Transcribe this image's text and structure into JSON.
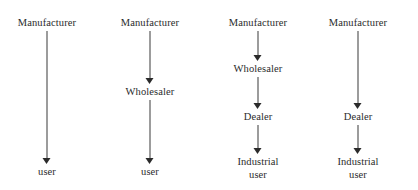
{
  "diagram": {
    "background_color": "#ffffff",
    "text_color": "#2b2b2b",
    "arrow_color": "#3a3a3a",
    "channels": [
      {
        "name": "direct-channel",
        "center_x": 47,
        "nodes": [
          {
            "label": "Manufacturer",
            "y": 17
          },
          {
            "label": "user",
            "y": 166
          }
        ],
        "arrows": [
          {
            "from_y": 31,
            "to_y": 164
          }
        ]
      },
      {
        "name": "wholesaler-channel",
        "center_x": 150,
        "nodes": [
          {
            "label": "Manufacturer",
            "y": 17
          },
          {
            "label": "Wholesaler",
            "y": 86
          },
          {
            "label": "user",
            "y": 166
          }
        ],
        "arrows": [
          {
            "from_y": 31,
            "to_y": 84
          },
          {
            "from_y": 100,
            "to_y": 164
          }
        ]
      },
      {
        "name": "wholesaler-dealer-channel",
        "center_x": 258,
        "nodes": [
          {
            "label": "Manufacturer",
            "y": 17
          },
          {
            "label": "Wholesaler",
            "y": 63
          },
          {
            "label": "Dealer",
            "y": 111
          },
          {
            "label": "Industrial\nuser",
            "y": 156
          }
        ],
        "arrows": [
          {
            "from_y": 31,
            "to_y": 61
          },
          {
            "from_y": 77,
            "to_y": 109
          },
          {
            "from_y": 125,
            "to_y": 154
          }
        ]
      },
      {
        "name": "dealer-channel",
        "center_x": 358,
        "nodes": [
          {
            "label": "Manufacturer",
            "y": 17
          },
          {
            "label": "Dealer",
            "y": 111
          },
          {
            "label": "Industrial\nuser",
            "y": 156
          }
        ],
        "arrows": [
          {
            "from_y": 31,
            "to_y": 109
          },
          {
            "from_y": 125,
            "to_y": 154
          }
        ]
      }
    ]
  }
}
